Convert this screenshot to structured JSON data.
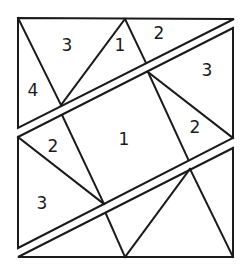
{
  "diagram": {
    "type": "dissection-puzzle",
    "stroke_color": "#1a1a1a",
    "background": "#ffffff",
    "pieces": {
      "top": {
        "outline": [
          [
            18,
            18
          ],
          [
            234,
            19
          ],
          [
            18,
            128
          ]
        ],
        "lines": [
          [
            [
              18,
              18
            ],
            [
              61,
              105
            ]
          ],
          [
            [
              125,
              19
            ],
            [
              61,
              105
            ]
          ],
          [
            [
              125,
              19
            ],
            [
              146,
              63
            ]
          ]
        ],
        "labels": [
          {
            "text": "4",
            "x": 33,
            "y": 90
          },
          {
            "text": "3",
            "x": 67,
            "y": 45
          },
          {
            "text": "1",
            "x": 120,
            "y": 45
          },
          {
            "text": "2",
            "x": 159,
            "y": 33
          }
        ]
      },
      "middle": {
        "outline": [
          [
            18,
            137
          ],
          [
            233,
            28
          ],
          [
            233,
            138
          ],
          [
            18,
            248
          ]
        ],
        "lines": [
          [
            [
              62,
              115
            ],
            [
              104,
              204
            ]
          ],
          [
            [
              148,
              72
            ],
            [
              188,
              159
            ]
          ],
          [
            [
              18,
              137
            ],
            [
              104,
              204
            ]
          ],
          [
            [
              148,
              72
            ],
            [
              233,
              138
            ]
          ]
        ],
        "labels": [
          {
            "text": "2",
            "x": 53,
            "y": 146
          },
          {
            "text": "1",
            "x": 124,
            "y": 139
          },
          {
            "text": "3",
            "x": 207,
            "y": 70
          },
          {
            "text": "2",
            "x": 195,
            "y": 127
          },
          {
            "text": "3",
            "x": 42,
            "y": 203
          }
        ]
      },
      "bottom": {
        "outline": [
          [
            18,
            257
          ],
          [
            233,
            148
          ],
          [
            233,
            257
          ]
        ],
        "lines": [
          [
            [
              106,
              214
            ],
            [
              125,
              257
            ]
          ],
          [
            [
              190,
              169
            ],
            [
              125,
              257
            ]
          ],
          [
            [
              190,
              169
            ],
            [
              233,
              257
            ]
          ]
        ],
        "labels": []
      }
    }
  }
}
